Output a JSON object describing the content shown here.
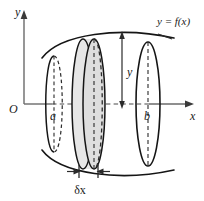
{
  "figure": {
    "title_label": "y = f(x)",
    "axes": {
      "x_label": "x",
      "y_label": "y",
      "origin_label": "O"
    },
    "markers": {
      "left_bound": "a",
      "right_bound": "b",
      "radius_label": "y",
      "thickness_label": "δx"
    },
    "colors": {
      "curve": "#1a1a1a",
      "axis": "#5a5a5a",
      "hidden_edge": "#3b3b3b",
      "disc_fill": "#e4e4e4",
      "background": "#ffffff",
      "text": "#1a1a1a"
    },
    "geometry": {
      "axis_y_px": 104,
      "a_x_px": 54,
      "disc_front_x_px": 94,
      "disc_back_x_px": 83,
      "b_x_px": 148,
      "ellipse_ry_a_px": 48,
      "ellipse_ry_disc_px": 65,
      "ellipse_ry_b_px": 62
    }
  }
}
